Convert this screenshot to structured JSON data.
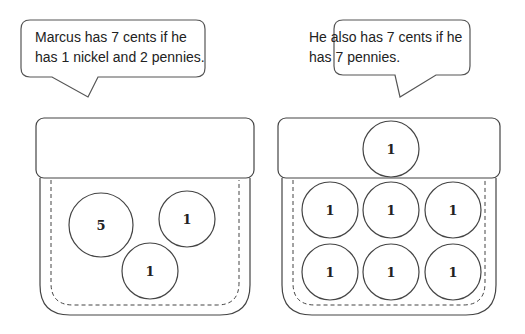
{
  "bubbles": [
    {
      "line1": "Marcus has 7 cents if he",
      "line2": "has 1 nickel and 2 pennies."
    },
    {
      "line1": "He also has 7 cents if he",
      "line2": "has 7 pennies."
    }
  ],
  "purses": [
    {
      "coins": [
        {
          "label": "5",
          "cx": 101,
          "cy": 225,
          "r": 32
        },
        {
          "label": "1",
          "cx": 187,
          "cy": 219,
          "r": 28
        },
        {
          "label": "1",
          "cx": 150,
          "cy": 271,
          "r": 28
        }
      ]
    },
    {
      "coins": [
        {
          "label": "1",
          "cx": 391,
          "cy": 149,
          "r": 28
        },
        {
          "label": "1",
          "cx": 330,
          "cy": 210,
          "r": 28
        },
        {
          "label": "1",
          "cx": 391,
          "cy": 210,
          "r": 28
        },
        {
          "label": "1",
          "cx": 453,
          "cy": 210,
          "r": 28
        },
        {
          "label": "1",
          "cx": 330,
          "cy": 272,
          "r": 28
        },
        {
          "label": "1",
          "cx": 391,
          "cy": 272,
          "r": 28
        },
        {
          "label": "1",
          "cx": 453,
          "cy": 272,
          "r": 28
        }
      ]
    }
  ],
  "colors": {
    "stroke": "#444444",
    "background": "#ffffff"
  }
}
